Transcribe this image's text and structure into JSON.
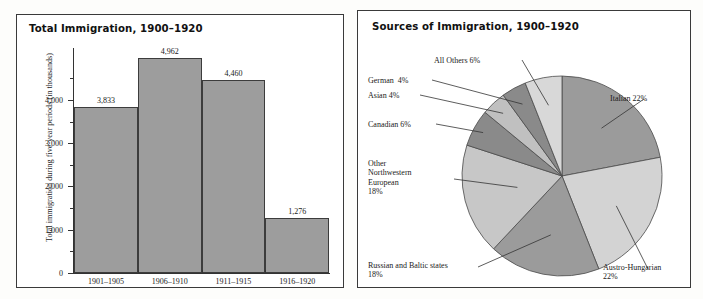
{
  "page": {
    "background_color": "#fdfdfb",
    "panel_border_color": "#3a3a3a"
  },
  "bar_panel": {
    "title": "Total Immigration, 1900–1920"
  },
  "pie_panel": {
    "title": "Sources of Immigration, 1900–1920"
  },
  "chart_data": [
    {
      "type": "bar",
      "title": "Total Immigration, 1900–1920",
      "xlabel": "",
      "ylabel": "Total immigration during five-year periods (in thousands)",
      "categories": [
        "1901–1905",
        "1906–1910",
        "1911–1915",
        "1916–1920"
      ],
      "values": [
        3833,
        4962,
        4460,
        1276
      ],
      "value_labels": [
        "3,833",
        "4,962",
        "4,460",
        "1,276"
      ],
      "ylim": [
        0,
        5200
      ],
      "ytick_values": [
        0,
        1000,
        2000,
        3000,
        4000
      ],
      "ytick_labels": [
        "0",
        "1,000",
        "2,000",
        "3,000",
        "4,000"
      ],
      "yminor_values": [
        500,
        1500,
        2500,
        3500,
        4500
      ],
      "grid": false,
      "legend": "none",
      "bar_color": "#9d9d9d",
      "bar_border_color": "#3c3c3c"
    },
    {
      "type": "pie",
      "title": "Sources of Immigration, 1900–1920",
      "legend": "callout-labels",
      "start_angle_deg": 0,
      "direction": "clockwise",
      "slices": [
        {
          "name": "Italian",
          "label": "Italian 22%",
          "value": 22,
          "color": "#9b9b9b"
        },
        {
          "name": "Austro-Hungarian",
          "label": "Austro-Hungarian\n22%",
          "value": 22,
          "color": "#d3d3d3"
        },
        {
          "name": "Russian and Baltic states",
          "label": "Russian and Baltic states\n18%",
          "value": 18,
          "color": "#9b9b9b"
        },
        {
          "name": "Other Northwestern European",
          "label": "Other\nNorthwestern\nEuropean\n18%",
          "value": 18,
          "color": "#c7c7c7"
        },
        {
          "name": "Canadian",
          "label": "Canadian 6%",
          "value": 6,
          "color": "#8a8a8a"
        },
        {
          "name": "Asian",
          "label": "Asian 4%",
          "value": 4,
          "color": "#c0c0c0"
        },
        {
          "name": "German",
          "label": "German  4%",
          "value": 4,
          "color": "#8a8a8a"
        },
        {
          "name": "All Others",
          "label": "All Others 6%",
          "value": 6,
          "color": "#d8d8d8"
        }
      ],
      "total": 100
    }
  ]
}
